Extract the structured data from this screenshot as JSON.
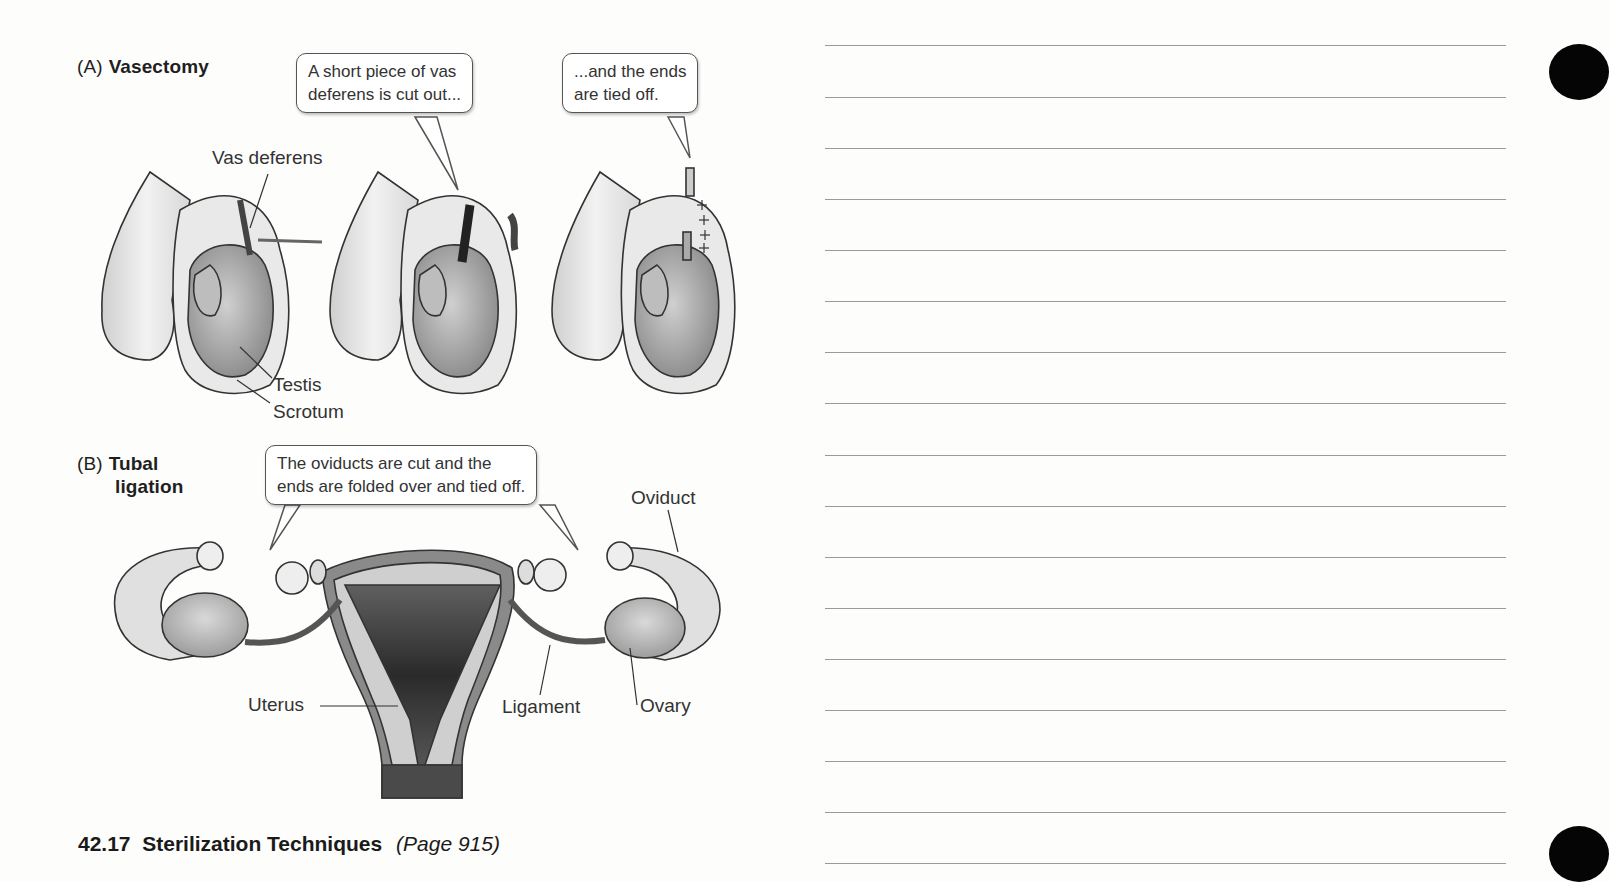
{
  "figure": {
    "number": "42.17",
    "title": "Sterilization Techniques",
    "page_ref": "(Page 915)"
  },
  "panel_a": {
    "letter": "(A)",
    "title": "Vasectomy",
    "bubbles": [
      {
        "lines": [
          "A short piece of vas",
          "deferens is cut out..."
        ]
      },
      {
        "lines": [
          "...and the ends",
          "are tied off."
        ]
      }
    ],
    "labels": {
      "vas_deferens": "Vas deferens",
      "testis": "Testis",
      "scrotum": "Scrotum"
    }
  },
  "panel_b": {
    "letter": "(B)",
    "title_line1": "Tubal",
    "title_line2": "ligation",
    "bubble": {
      "lines": [
        "The oviducts are cut and the",
        "ends are folded over and tied off."
      ]
    },
    "labels": {
      "oviduct": "Oviduct",
      "uterus": "Uterus",
      "ligament": "Ligament",
      "ovary": "Ovary"
    }
  },
  "notes": {
    "line_count": 17,
    "line_positions_y": [
      45,
      97,
      148,
      199,
      250,
      301,
      352,
      403,
      455,
      506,
      557,
      608,
      659,
      710,
      761,
      812,
      863
    ]
  },
  "colors": {
    "background": "#fdfdfc",
    "text": "#1e1e1e",
    "rule": "#9a9a9a",
    "tissue_light": "#e4e4e4",
    "tissue_mid": "#b0b0b0",
    "tissue_dark": "#3a3a3a",
    "punch_hole": "#050505"
  }
}
